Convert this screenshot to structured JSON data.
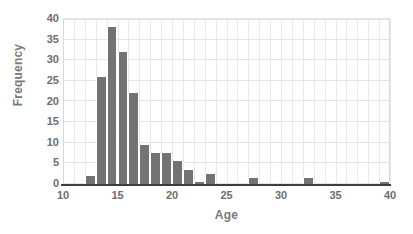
{
  "chart_data": {
    "type": "bar",
    "title": "",
    "subtitle": "",
    "xlabel": "Age",
    "ylabel": "Frequency",
    "xlim": [
      10,
      40
    ],
    "ylim": [
      0,
      40
    ],
    "bin_width": 1,
    "grid": {
      "vertical": true,
      "vertical_step": 1,
      "horizontal": true,
      "horizontal_step": 5
    },
    "legend": null,
    "legend_position": "none",
    "xticks": [
      10,
      15,
      20,
      25,
      30,
      35,
      40
    ],
    "xtick_labels": [
      "10",
      "15",
      "20",
      "25",
      "30",
      "35",
      "40"
    ],
    "yticks": [
      0,
      5,
      10,
      15,
      20,
      25,
      30,
      35,
      40
    ],
    "ytick_labels": [
      "0",
      "5",
      "10",
      "15",
      "20",
      "25",
      "30",
      "35",
      "40"
    ],
    "categories": [
      12,
      13,
      14,
      15,
      16,
      17,
      18,
      19,
      20,
      21,
      22,
      23,
      27,
      32,
      39
    ],
    "values": [
      2,
      26,
      38,
      32,
      22,
      9.5,
      7.5,
      7.5,
      5.5,
      3.5,
      0.5,
      2.5,
      1.5,
      1.5,
      0.5
    ],
    "bars": [
      {
        "x": 12,
        "value": 2
      },
      {
        "x": 13,
        "value": 26
      },
      {
        "x": 14,
        "value": 38
      },
      {
        "x": 15,
        "value": 32
      },
      {
        "x": 16,
        "value": 22
      },
      {
        "x": 17,
        "value": 9.5
      },
      {
        "x": 18,
        "value": 7.5
      },
      {
        "x": 19,
        "value": 7.5
      },
      {
        "x": 20,
        "value": 5.5
      },
      {
        "x": 21,
        "value": 3.5
      },
      {
        "x": 22,
        "value": 0.5
      },
      {
        "x": 23,
        "value": 2.5
      },
      {
        "x": 27,
        "value": 1.5
      },
      {
        "x": 32,
        "value": 1.5
      },
      {
        "x": 39,
        "value": 0.5
      }
    ],
    "annotations": []
  },
  "colors": {
    "bar": "#737373",
    "bar_separator": "#ffffff",
    "grid": "#e9e9e9",
    "axis_line": "#3d3d3d",
    "tick_label": "#6e6e6e",
    "axis_title": "#7a7a7a",
    "background": "#ffffff"
  }
}
